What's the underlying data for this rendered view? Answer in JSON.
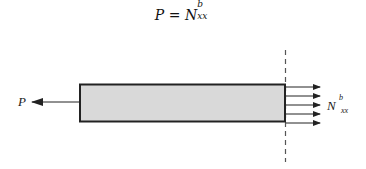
{
  "equation": {
    "lhs": "P",
    "equals": "=",
    "rhs_base": "N",
    "rhs_sup": "b",
    "rhs_sub": "xx"
  },
  "diagram": {
    "left_force_label": "P",
    "right_force_label_base": "N",
    "right_force_label_sup": "b",
    "right_force_label_sub": "xx",
    "right_arrow_count": 5,
    "colors": {
      "bar_fill": "#d9d9d9",
      "bar_stroke": "#222222",
      "lines": "#222222",
      "dashed_line": "#555555"
    }
  }
}
